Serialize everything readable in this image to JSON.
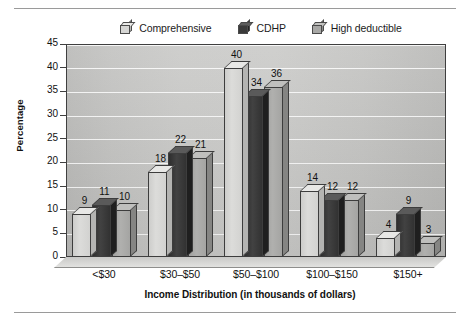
{
  "figure": {
    "rules": {
      "top_label": "top-divider-rule",
      "bottom_label": "bottom-divider-rule"
    }
  },
  "legend": {
    "position": "top-center",
    "items": [
      {
        "label": "Comprehensive",
        "key": "comprehensive",
        "color": "#d6d6d4",
        "swatch_name": "legend-swatch-comprehensive"
      },
      {
        "label": "CDHP",
        "key": "cdhp",
        "color": "#3a3a3a",
        "swatch_name": "legend-swatch-cdhp"
      },
      {
        "label": "High deductible",
        "key": "highded",
        "color": "#a8a8a6",
        "swatch_name": "legend-swatch-high-deductible"
      }
    ]
  },
  "axes": {
    "y_title": "Percentage",
    "x_title": "Income Distribution (in thousands of dollars)",
    "y_ticks": [
      "45",
      "40",
      "35",
      "30",
      "25",
      "20",
      "15",
      "10",
      "5",
      "0"
    ],
    "x_ticks": [
      "<$30",
      "$30–$50",
      "$50–$100",
      "$100–$150",
      "$150+"
    ]
  },
  "chart_data": {
    "type": "bar",
    "title": "",
    "subtitle": "",
    "xlabel": "Income Distribution (in thousands of dollars)",
    "ylabel": "Percentage",
    "categories": [
      "<$30",
      "$30–$50",
      "$50–$100",
      "$100–$150",
      "$150+"
    ],
    "series": [
      {
        "name": "Comprehensive",
        "values": [
          9,
          18,
          40,
          14,
          4
        ],
        "color": "#d6d6d4"
      },
      {
        "name": "CDHP",
        "values": [
          11,
          22,
          34,
          12,
          9
        ],
        "color": "#3a3a3a"
      },
      {
        "name": "High deductible",
        "values": [
          10,
          21,
          36,
          12,
          3
        ],
        "color": "#a8a8a6"
      }
    ],
    "ylim": [
      0,
      45
    ],
    "ytick_step": 5,
    "grid": true,
    "grid_axis": "y",
    "legend_position": "top",
    "data_labels": true,
    "style": "3d-grouped-bar-grayscale"
  }
}
